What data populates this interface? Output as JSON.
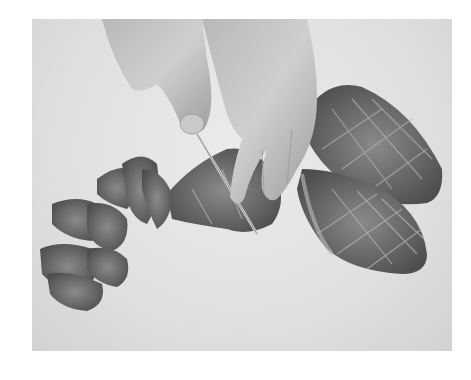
{
  "image": {
    "alt": "Hands slicing a scored, seared meat fillet with a knife on a white cutting board; cut pieces on the left and two whole scored fillets on the right",
    "style": "grayscale photograph",
    "colors": {
      "background": "#ffffff",
      "board": "#e4e4e4",
      "meat_dark": "#5a5a5a",
      "meat_mid": "#8a8a8a",
      "skin": "#c4c4c4"
    }
  }
}
